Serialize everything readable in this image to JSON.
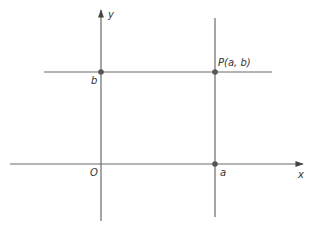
{
  "diagram": {
    "type": "coordinate-plane",
    "axes": {
      "x_label": "x",
      "y_label": "y",
      "origin_label": "O"
    },
    "lines": {
      "vertical_label": "a",
      "horizontal_label": "b"
    },
    "point": {
      "label": "P(a, b)"
    },
    "colors": {
      "line": "#6b6b6b",
      "point": "#555555",
      "text": "#333333"
    }
  }
}
